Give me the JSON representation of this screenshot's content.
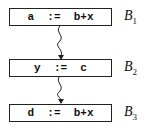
{
  "diagram": {
    "type": "control-flow-graph",
    "blocks": [
      {
        "id": "B1",
        "code": "a  :=  b+x",
        "label": "B",
        "subscript": "1"
      },
      {
        "id": "B2",
        "code": "y  :=  c",
        "label": "B",
        "subscript": "2"
      },
      {
        "id": "B3",
        "code": "d  :=  b+x",
        "label": "B",
        "subscript": "3"
      }
    ],
    "edges": [
      {
        "from": "B1",
        "to": "B2",
        "style": "wavy-arrow"
      },
      {
        "from": "B2",
        "to": "B3",
        "style": "wavy-arrow"
      }
    ]
  }
}
